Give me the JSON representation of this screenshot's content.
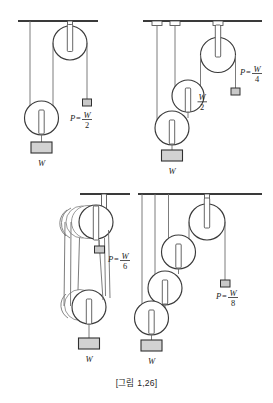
{
  "figure": {
    "caption": "[그림 1,26]",
    "panels": [
      {
        "id": "panel-top-left",
        "name": "single-movable-pulley",
        "pulley_count": 2,
        "effort_label_prefix": "P",
        "effort_equals": "=",
        "effort_numerator": "W",
        "effort_denominator": "2",
        "load_label": "W",
        "intermediate_labels": []
      },
      {
        "id": "panel-top-right",
        "name": "two-movable-pulleys",
        "pulley_count": 3,
        "effort_label_prefix": "P",
        "effort_equals": "=",
        "effort_numerator": "W",
        "effort_denominator": "4",
        "load_label": "W",
        "intermediate_labels": [
          {
            "numerator": "W",
            "denominator": "2"
          }
        ]
      },
      {
        "id": "panel-bottom-left",
        "name": "block-and-tackle-six-parts",
        "pulley_count": 5,
        "effort_label_prefix": "P",
        "effort_equals": "=",
        "effort_numerator": "W",
        "effort_denominator": "6",
        "load_label": "W",
        "intermediate_labels": []
      },
      {
        "id": "panel-bottom-right",
        "name": "three-movable-pulleys",
        "pulley_count": 4,
        "effort_label_prefix": "P",
        "effort_equals": "=",
        "effort_numerator": "W",
        "effort_denominator": "8",
        "load_label": "W",
        "intermediate_labels": []
      }
    ],
    "colors": {
      "ceiling": "#3a3a3a",
      "rope": "#6d6d6d",
      "wheel_stroke": "#3a3a3a",
      "weight_fill": "#d2d2d2",
      "effort_fill": "#c9c9c9",
      "text": "#1c1c1c",
      "background": "#ffffff"
    }
  }
}
